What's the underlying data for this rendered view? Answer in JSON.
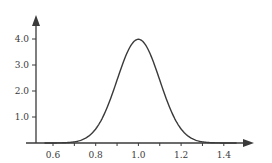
{
  "chart_data": {
    "type": "line",
    "title": "",
    "xlabel": "",
    "ylabel": "",
    "series": [
      {
        "name": "density",
        "function": "normal_pdf",
        "mean": 1.0,
        "std": 0.1,
        "x": [
          0.55,
          0.6,
          0.65,
          0.7,
          0.75,
          0.8,
          0.85,
          0.9,
          0.95,
          1.0,
          1.05,
          1.1,
          1.15,
          1.2,
          1.25,
          1.3,
          1.35,
          1.4,
          1.45
        ],
        "values": [
          0.0,
          0.0,
          0.01,
          0.04,
          0.18,
          0.54,
          1.3,
          2.42,
          3.52,
          3.99,
          3.52,
          2.42,
          1.3,
          0.54,
          0.18,
          0.04,
          0.01,
          0.0,
          0.0
        ]
      }
    ],
    "x_ticks": [
      0.6,
      0.8,
      1.0,
      1.2,
      1.4
    ],
    "x_tick_labels": [
      "0.6",
      "0.8",
      "1.0",
      "1.2",
      "1.4"
    ],
    "x_minor_ticks": [
      0.7,
      0.9,
      1.1,
      1.3
    ],
    "y_ticks": [
      1.0,
      2.0,
      3.0,
      4.0
    ],
    "y_tick_labels": [
      "1.0",
      "2.0",
      "3.0",
      "4.0"
    ],
    "xlim": [
      0.52,
      1.55
    ],
    "ylim": [
      0,
      4.9
    ],
    "grid": false,
    "legend": null,
    "axes_style": "arrowheads on positive ends of both axes",
    "line_color": "#3a3a3a",
    "axis_color": "#3a3a3a"
  }
}
